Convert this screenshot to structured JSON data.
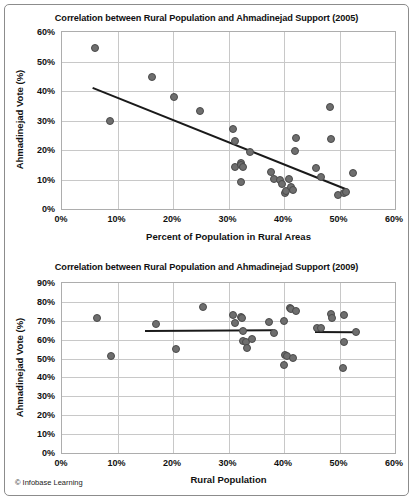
{
  "figure": {
    "credit": "© Infobase Learning",
    "accent_marker_color": "#6e6e6e",
    "trendline_color": "#1a1a1a",
    "gridline_color": "#c8c8c8",
    "frame_color": "#8c8c8c"
  },
  "charts": [
    {
      "id": "chart-2005",
      "title": "Correlation between Rural Population and Ahmadinejad Support (2005)",
      "xlabel": "Percent of Population in Rural Areas",
      "ylabel": "Ahmadinejad Vote (%)",
      "xticks": [
        "0%",
        "10%",
        "20%",
        "30%",
        "40%",
        "50%",
        "60%"
      ],
      "yticks": [
        "60%",
        "50%",
        "40%",
        "30%",
        "20%",
        "10%",
        "0%"
      ]
    },
    {
      "id": "chart-2009",
      "title": "Correlation between Rural Population and Ahmadinejad Support (2009)",
      "xlabel": "Rural Population",
      "ylabel": "Ahmadinejad Vote (%)",
      "xticks": [
        "0%",
        "10%",
        "20%",
        "30%",
        "40%",
        "50%",
        "60%"
      ],
      "yticks": [
        "90%",
        "80%",
        "70%",
        "60%",
        "50%",
        "40%",
        "30%",
        "20%",
        "10%",
        "0%"
      ]
    }
  ],
  "chart_data": [
    {
      "type": "scatter",
      "title": "Correlation between Rural Population and Ahmadinejad Support (2005)",
      "xlabel": "Percent of Population in Rural Areas",
      "ylabel": "Ahmadinejad Vote (%)",
      "xlim": [
        0,
        60
      ],
      "ylim": [
        0,
        60
      ],
      "xtick_values": [
        0,
        10,
        20,
        30,
        40,
        50,
        60
      ],
      "ytick_values": [
        0,
        10,
        20,
        30,
        40,
        50,
        60
      ],
      "grid": true,
      "legend": "none",
      "points": [
        {
          "x": 6.0,
          "y": 54.7
        },
        {
          "x": 8.6,
          "y": 29.7
        },
        {
          "x": 16.3,
          "y": 44.8
        },
        {
          "x": 20.1,
          "y": 37.8
        },
        {
          "x": 24.9,
          "y": 33.1
        },
        {
          "x": 30.9,
          "y": 27.2
        },
        {
          "x": 31.2,
          "y": 23.0
        },
        {
          "x": 31.2,
          "y": 14.2
        },
        {
          "x": 32.2,
          "y": 15.5
        },
        {
          "x": 32.3,
          "y": 15.0
        },
        {
          "x": 32.6,
          "y": 14.3
        },
        {
          "x": 32.3,
          "y": 9.2
        },
        {
          "x": 33.9,
          "y": 19.4
        },
        {
          "x": 37.6,
          "y": 12.7
        },
        {
          "x": 38.2,
          "y": 10.2
        },
        {
          "x": 39.3,
          "y": 9.8
        },
        {
          "x": 39.6,
          "y": 8.6
        },
        {
          "x": 40.1,
          "y": 5.4
        },
        {
          "x": 40.3,
          "y": 6.0
        },
        {
          "x": 40.9,
          "y": 10.1
        },
        {
          "x": 41.2,
          "y": 7.6
        },
        {
          "x": 41.7,
          "y": 6.3
        },
        {
          "x": 42.1,
          "y": 23.9
        },
        {
          "x": 42.0,
          "y": 19.6
        },
        {
          "x": 45.8,
          "y": 13.8
        },
        {
          "x": 46.6,
          "y": 10.9
        },
        {
          "x": 48.3,
          "y": 34.5
        },
        {
          "x": 48.4,
          "y": 23.7
        },
        {
          "x": 49.8,
          "y": 4.6
        },
        {
          "x": 50.8,
          "y": 5.3
        },
        {
          "x": 51.2,
          "y": 5.6
        },
        {
          "x": 52.5,
          "y": 12.3
        }
      ],
      "trendlines": [
        {
          "x0": 5.5,
          "y0": 41.2,
          "x1": 51.5,
          "y1": 6.6
        }
      ]
    },
    {
      "type": "scatter",
      "title": "Correlation between Rural Population and Ahmadinejad Support (2009)",
      "xlabel": "Rural Population",
      "ylabel": "Ahmadinejad Vote (%)",
      "xlim": [
        0,
        60
      ],
      "ylim": [
        0,
        90
      ],
      "xtick_values": [
        0,
        10,
        20,
        30,
        40,
        50,
        60
      ],
      "ytick_values": [
        0,
        10,
        20,
        30,
        40,
        50,
        60,
        70,
        80,
        90
      ],
      "grid": true,
      "legend": "none",
      "points": [
        {
          "x": 6.3,
          "y": 71.4
        },
        {
          "x": 8.9,
          "y": 51.4
        },
        {
          "x": 16.9,
          "y": 68.1
        },
        {
          "x": 20.5,
          "y": 55.3
        },
        {
          "x": 25.4,
          "y": 77.4
        },
        {
          "x": 30.8,
          "y": 72.8
        },
        {
          "x": 31.2,
          "y": 68.9
        },
        {
          "x": 32.2,
          "y": 72.0
        },
        {
          "x": 32.4,
          "y": 71.3
        },
        {
          "x": 32.6,
          "y": 64.5
        },
        {
          "x": 32.7,
          "y": 59.3
        },
        {
          "x": 33.1,
          "y": 58.8
        },
        {
          "x": 33.3,
          "y": 55.6
        },
        {
          "x": 34.2,
          "y": 60.4
        },
        {
          "x": 37.3,
          "y": 69.3
        },
        {
          "x": 38.2,
          "y": 63.7
        },
        {
          "x": 40.0,
          "y": 69.8
        },
        {
          "x": 40.2,
          "y": 52.0
        },
        {
          "x": 40.5,
          "y": 51.4
        },
        {
          "x": 40.0,
          "y": 46.6
        },
        {
          "x": 41.0,
          "y": 77.0
        },
        {
          "x": 41.3,
          "y": 76.2
        },
        {
          "x": 41.6,
          "y": 50.2
        },
        {
          "x": 42.1,
          "y": 75.1
        },
        {
          "x": 45.9,
          "y": 66.2
        },
        {
          "x": 46.6,
          "y": 66.4
        },
        {
          "x": 48.4,
          "y": 73.4
        },
        {
          "x": 48.7,
          "y": 71.5
        },
        {
          "x": 50.9,
          "y": 73.0
        },
        {
          "x": 50.8,
          "y": 59.0
        },
        {
          "x": 50.6,
          "y": 44.8
        },
        {
          "x": 52.9,
          "y": 64.3
        }
      ],
      "trendlines": [
        {
          "x0": 14.9,
          "y0": 65.0,
          "x1": 38.0,
          "y1": 65.4
        },
        {
          "x0": 45.5,
          "y0": 64.6,
          "x1": 52.6,
          "y1": 64.4
        }
      ]
    }
  ]
}
